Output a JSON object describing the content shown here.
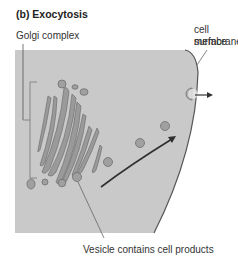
{
  "title": "(b) Exocytosis",
  "labels": {
    "golgi": "Golgi complex",
    "membrane_line1": "cell surface",
    "membrane_line2": "membrane",
    "vesicle": "Vesicle contains cell products"
  },
  "colors": {
    "cytoplasm": "#c8c8c8",
    "organelle_fill": "#9a9a9a",
    "organelle_stroke": "#6e6e6e",
    "membrane": "#555555",
    "leader_line": "#666666",
    "arrow": "#333333"
  }
}
